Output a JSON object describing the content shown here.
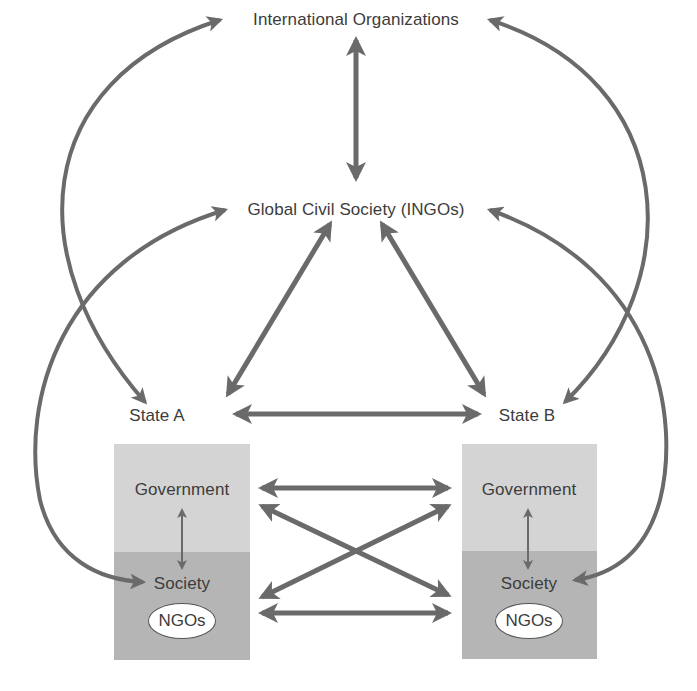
{
  "diagram": {
    "nodes": {
      "international_orgs": {
        "label": "International Organizations",
        "x": 356,
        "y": 20
      },
      "global_civil_society": {
        "label": "Global Civil Society (INGOs)",
        "x": 356,
        "y": 210
      },
      "state_a": {
        "label": "State A",
        "x": 157,
        "y": 416
      },
      "state_b": {
        "label": "State B",
        "x": 527,
        "y": 416
      },
      "gov_a": {
        "label": "Government",
        "x": 182,
        "y": 490
      },
      "gov_b": {
        "label": "Government",
        "x": 529,
        "y": 490
      },
      "society_a": {
        "label": "Society",
        "x": 182,
        "y": 584
      },
      "society_b": {
        "label": "Society",
        "x": 529,
        "y": 584
      },
      "ngos_a": {
        "label": "NGOs",
        "x": 182,
        "y": 621
      },
      "ngos_b": {
        "label": "NGOs",
        "x": 529,
        "y": 621
      }
    },
    "boxes": {
      "state_a_box": {
        "x": 114,
        "y": 444,
        "w": 136,
        "h": 216,
        "divider_y": 552
      },
      "state_b_box": {
        "x": 462,
        "y": 444,
        "w": 135,
        "h": 215,
        "divider_y": 551
      }
    },
    "colors": {
      "arrow": "#6a6a6a",
      "text": "#3c3c3c",
      "government_fill": "#d4d4d4",
      "society_fill": "#b5b5b5",
      "ngo_fill": "#ffffff"
    },
    "arrows": [
      {
        "id": "io-gcs",
        "d": "M356 40 L356 178",
        "w": 5
      },
      {
        "id": "io-stateb-arc",
        "d": "M220 20 C 30 80, 20 260, 145 402",
        "w": 4
      },
      {
        "id": "io-statea-arc",
        "d": "M490 20 C 680 80, 690 280, 565 402",
        "w": 4
      },
      {
        "id": "gcs-societya-arc",
        "d": "M225 210 C 60 260, 20 400, 40 500 C 55 560, 100 580, 143 582",
        "w": 4
      },
      {
        "id": "gcs-societyb-arc",
        "d": "M490 210 C 660 270, 680 420, 660 500 C 645 555, 610 575, 575 580",
        "w": 4
      },
      {
        "id": "gcs-statea",
        "d": "M330 224 L228 394",
        "w": 5
      },
      {
        "id": "gcs-stateb",
        "d": "M382 224 L484 394",
        "w": 5
      },
      {
        "id": "statea-stateb",
        "d": "M236 414 L478 414",
        "w": 5
      },
      {
        "id": "gova-govb",
        "d": "M262 488 L448 488",
        "w": 5
      },
      {
        "id": "gova-socb",
        "d": "M262 506 L448 595",
        "w": 5
      },
      {
        "id": "socb-gova",
        "d": "M262 597 L448 506",
        "w": 5
      },
      {
        "id": "soca-socb",
        "d": "M262 613 L448 613",
        "w": 5
      },
      {
        "id": "gova-soca",
        "d": "M182 510 L182 568",
        "w": 2
      },
      {
        "id": "govb-socb",
        "d": "M528 510 L528 568",
        "w": 2
      }
    ]
  }
}
